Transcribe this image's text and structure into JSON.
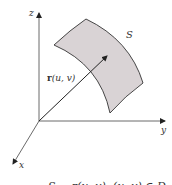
{
  "figure": {
    "axes": {
      "z_label": "z",
      "y_label": "y",
      "x_label": "x"
    },
    "surface_label": "S",
    "vector_label_bold": "r",
    "vector_label_args": "(u, v)",
    "caption": "S = r(u, v), (u, v) ∈ D",
    "colors": {
      "surface_fill": "#d9d3d5",
      "stroke": "#333333",
      "background": "#ffffff"
    }
  }
}
